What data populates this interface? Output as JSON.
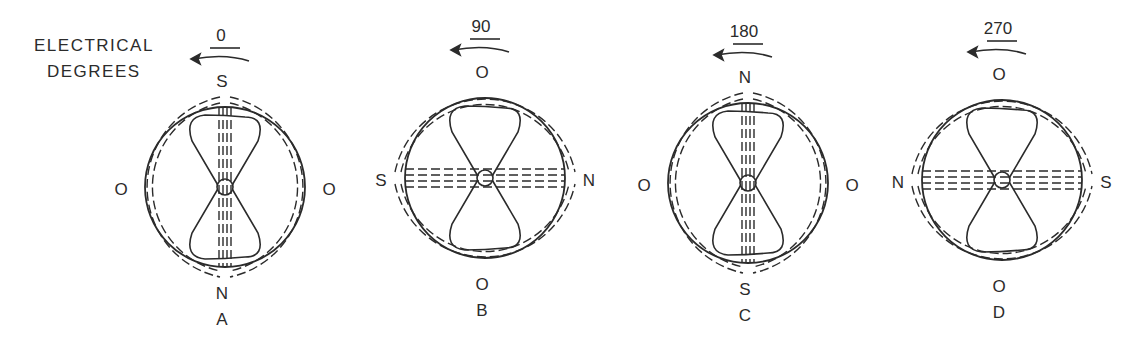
{
  "figure": {
    "caption_line1": "ELECTRICAL",
    "caption_line2": "DEGREES",
    "rotation_direction": "counterclockwise",
    "panels": [
      {
        "id": "A",
        "degrees": "0",
        "top": "S",
        "bottom": "N",
        "left": "O",
        "right": "O",
        "letter": "A",
        "flux_axis": "vertical",
        "cx": 225,
        "cy": 187
      },
      {
        "id": "B",
        "degrees": "90",
        "top": "O",
        "bottom": "O",
        "left": "S",
        "right": "N",
        "letter": "B",
        "flux_axis": "horizontal",
        "cx": 485,
        "cy": 178
      },
      {
        "id": "C",
        "degrees": "180",
        "top": "N",
        "bottom": "S",
        "left": "O",
        "right": "O",
        "letter": "C",
        "flux_axis": "vertical",
        "cx": 748,
        "cy": 183
      },
      {
        "id": "D",
        "degrees": "270",
        "top": "O",
        "bottom": "O",
        "left": "N",
        "right": "S",
        "letter": "D",
        "flux_axis": "horizontal",
        "cx": 1002,
        "cy": 180
      }
    ],
    "colors": {
      "ink": "#2b2b2b",
      "background": "#ffffff"
    }
  }
}
